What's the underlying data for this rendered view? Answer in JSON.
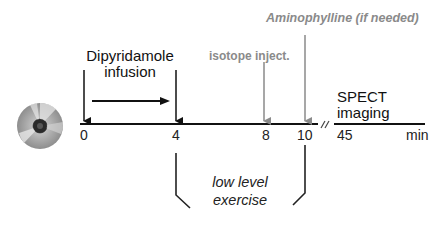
{
  "diagram": {
    "title_labels": {
      "dipyridamole": [
        "Dipyridamole",
        "infusion"
      ],
      "isotope": "isotope inject.",
      "aminophylline": "Aminophylline (if needed)",
      "spect": [
        "SPECT",
        "imaging"
      ],
      "exercise": [
        "low level",
        "exercise"
      ]
    },
    "timeline": {
      "ticks": [
        "0",
        "4",
        "8",
        "10",
        "45"
      ],
      "unit": "min",
      "break_marker": "//"
    },
    "icons": {
      "disc": "cd-disc-icon"
    },
    "colors": {
      "primary": "#111111",
      "secondary": "#8a8a8a",
      "background": "#ffffff"
    }
  }
}
